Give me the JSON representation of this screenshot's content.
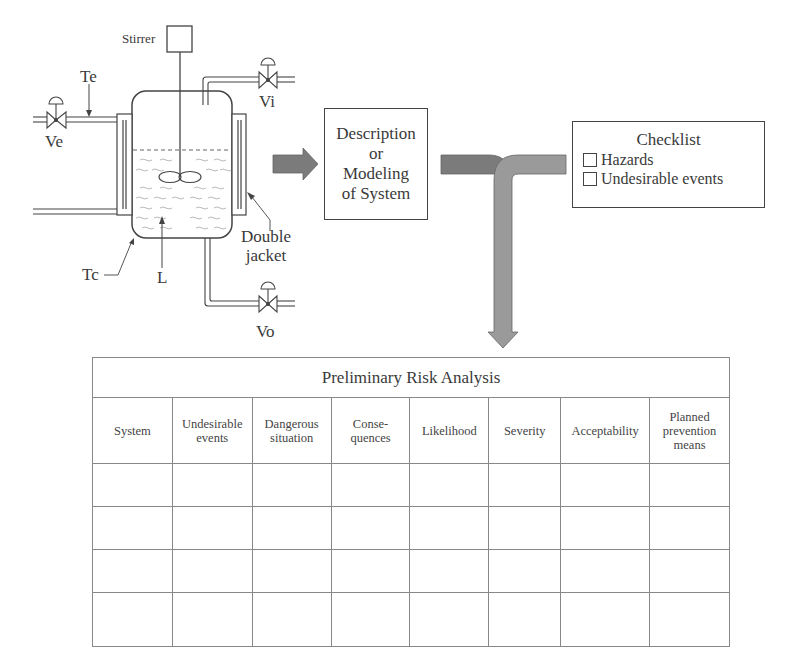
{
  "reactor": {
    "labels": {
      "stirrer": "Stirrer",
      "te": "Te",
      "ve": "Ve",
      "vi": "Vi",
      "vo": "Vo",
      "tc": "Tc",
      "l": "L",
      "double_jacket_line1": "Double",
      "double_jacket_line2": "jacket"
    }
  },
  "description_box": {
    "lines": [
      "Description",
      "or",
      "Modeling",
      "of System"
    ]
  },
  "checklist": {
    "title": "Checklist",
    "items": [
      {
        "label": "Hazards",
        "checked": false
      },
      {
        "label": "Undesirable events",
        "checked": false
      }
    ]
  },
  "pra_table": {
    "title": "Preliminary Risk Analysis",
    "columns": [
      {
        "line1": "System",
        "line2": ""
      },
      {
        "line1": "Undesirable",
        "line2": "events"
      },
      {
        "line1": "Dangerous",
        "line2": "situation"
      },
      {
        "line1": "Conse-",
        "line2": "quences"
      },
      {
        "line1": "Likelihood",
        "line2": ""
      },
      {
        "line1": "Severity",
        "line2": ""
      },
      {
        "line1": "Acceptability",
        "line2": ""
      },
      {
        "line1": "Planned",
        "line2": "prevention",
        "line3": "means"
      }
    ],
    "empty_rows": 4
  },
  "colors": {
    "arrow_dark": "#7b7b7b",
    "arrow_light": "#9a9a9a",
    "line": "#444444"
  }
}
